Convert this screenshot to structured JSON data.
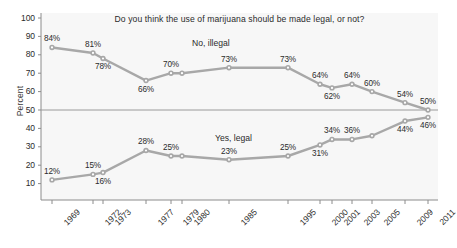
{
  "chart_data": {
    "type": "line",
    "title": "Do you think the use of marijuana should be made legal, or not?",
    "xlabel": "",
    "ylabel": "Percent",
    "ylim": [
      5,
      103
    ],
    "yticks": [
      10,
      20,
      30,
      40,
      50,
      60,
      70,
      80,
      90,
      100
    ],
    "grid": false,
    "gridline_at": 50,
    "legend_position": "inline-annotations",
    "categories": [
      "1969",
      "1972",
      "1973",
      "1977",
      "1979",
      "1980",
      "1985",
      "1995",
      "2000",
      "2001",
      "2003",
      "2005",
      "2009",
      "2011"
    ],
    "series": [
      {
        "name": "No, illegal",
        "color": "#a8a8a8",
        "values": [
          84,
          81,
          78,
          66,
          70,
          70,
          73,
          73,
          64,
          62,
          64,
          60,
          54,
          50
        ],
        "labels": [
          "84%",
          "81%",
          "78%",
          "66%",
          "70%",
          "",
          "73%",
          "73%",
          "64%",
          "62%",
          "64%",
          "60%",
          "54%",
          "50%"
        ],
        "label_side": [
          "above",
          "above",
          "below",
          "below",
          "above",
          "",
          "above",
          "above",
          "above",
          "below",
          "above",
          "above",
          "above",
          "above"
        ]
      },
      {
        "name": "Yes, legal",
        "color": "#a8a8a8",
        "values": [
          12,
          15,
          16,
          28,
          25,
          25,
          23,
          25,
          31,
          34,
          34,
          36,
          44,
          46
        ],
        "labels": [
          "12%",
          "15%",
          "16%",
          "28%",
          "25%",
          "",
          "23%",
          "25%",
          "31%",
          "34%",
          "36%",
          "",
          "44%",
          "46%"
        ],
        "label_side": [
          "above",
          "above",
          "below",
          "above",
          "above",
          "",
          "above",
          "above",
          "below",
          "above",
          "above",
          "",
          "below",
          "below"
        ]
      }
    ],
    "annotations": [
      {
        "text": "No, illegal",
        "near": "top-series"
      },
      {
        "text": "Yes, legal",
        "near": "bottom-series"
      }
    ]
  }
}
